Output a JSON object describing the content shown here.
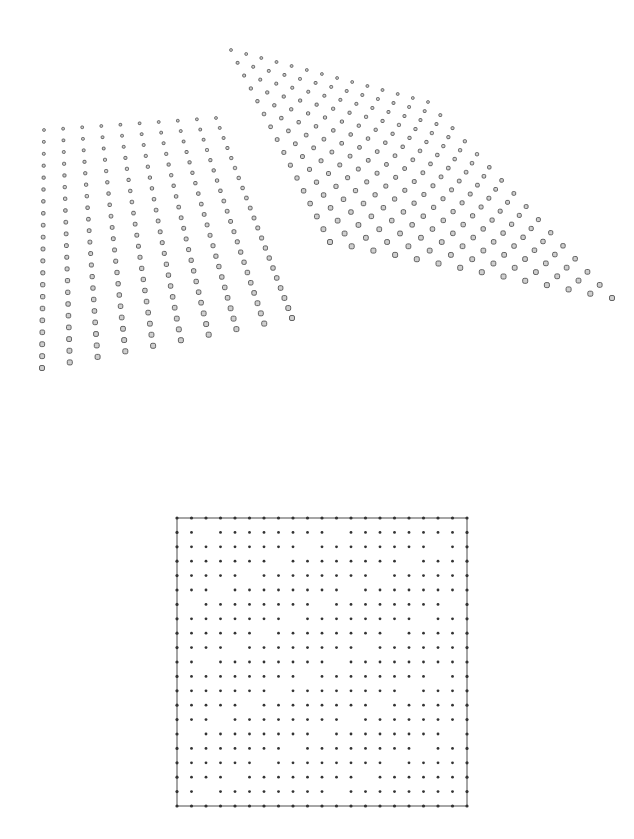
{
  "figure": {
    "top_panel": {
      "description": "Two perspective-projected point grids (3D surface samples)",
      "sheets": [
        {
          "name": "left-sheet",
          "rows": 21,
          "cols": 10,
          "corners": {
            "top_left": [
              44,
              130
            ],
            "top_right": [
              216,
              118
            ],
            "bottom_left": [
              42,
              368
            ],
            "bottom_right": [
              292,
              318
            ]
          },
          "point_color": "#555555",
          "point_fill": "#cfcfcf"
        },
        {
          "name": "right-sheet",
          "rows": 16,
          "cols": 14,
          "corners": {
            "top_left": [
              231,
              50
            ],
            "top_right": [
              428,
              102
            ],
            "bottom_left": [
              330,
              242
            ],
            "bottom_right": [
              612,
              298
            ]
          },
          "point_color": "#555555",
          "point_fill": "#cfcfcf"
        }
      ]
    },
    "bottom_panel": {
      "description": "Square frame with a regular 2D lattice of dots; diagonal gaps where points are absent",
      "frame": {
        "x": 177,
        "y": 518,
        "width": 290,
        "height": 288,
        "stroke": "#888888"
      },
      "lattice_size": 21,
      "gap_period": 9,
      "dot_color": "#333333"
    }
  }
}
